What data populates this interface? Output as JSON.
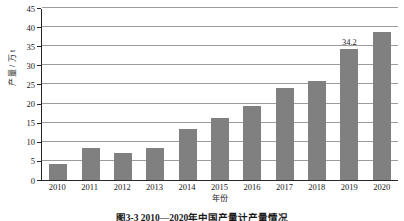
{
  "chart_data": {
    "type": "bar",
    "title": "",
    "xlabel": "年份",
    "ylabel": "产量 / 万 t",
    "categories": [
      "2010",
      "2011",
      "2012",
      "2013",
      "2014",
      "2015",
      "2016",
      "2017",
      "2018",
      "2019",
      "2020"
    ],
    "values": [
      4.1,
      8.4,
      7.1,
      8.5,
      13.4,
      16.3,
      19.4,
      24.2,
      25.8,
      34.2,
      38.7
    ],
    "data_labels": [
      null,
      null,
      null,
      null,
      null,
      null,
      null,
      null,
      null,
      "34.2",
      null
    ],
    "ylim": [
      0,
      45
    ],
    "yticks": [
      0,
      5,
      10,
      15,
      20,
      25,
      30,
      35,
      40,
      45
    ],
    "ytick_labels": [
      "0",
      "5",
      "10",
      "15",
      "20",
      "25",
      "30",
      "35",
      "40",
      "45"
    ],
    "grid": true,
    "legend": false,
    "bar_color": "#808080",
    "axis_color": "#262626",
    "gridline_color": "#9c9c9c"
  },
  "caption": {
    "text": "图3-3  2010—2020年中国产量计产量情况"
  }
}
